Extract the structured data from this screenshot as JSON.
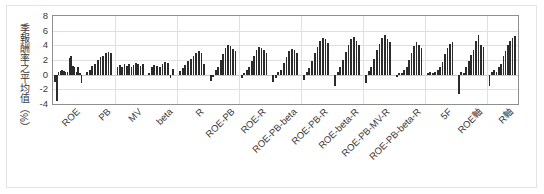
{
  "chart_data": {
    "type": "bar",
    "title": "",
    "subtitle": "",
    "xlabel": "",
    "ylabel": "季報酬率之平均值（%）",
    "ylim": [
      -4,
      8
    ],
    "yticks": [
      8,
      6,
      4,
      2,
      0,
      -2,
      -4
    ],
    "ytick_labels": [
      "8",
      "6",
      "4",
      "2",
      "0",
      "-2",
      "-4"
    ],
    "grid": true,
    "legend": "none",
    "categories": [
      "ROE",
      "PB",
      "MV",
      "beta",
      "R",
      "ROE-PB",
      "ROE-R",
      "ROE-PB-beta",
      "ROE-PB-R",
      "ROE-beta-R",
      "ROE-PB-MV-R",
      "ROE-PB-beta-R",
      "5F",
      "ROE軸",
      "R軸"
    ],
    "series": [
      {
        "name": "quarterly mean return by portfolio decile",
        "groups": [
          [
            -1.0,
            -3.6,
            0.4,
            0.5,
            0.6,
            0.5,
            0.3,
            0.4,
            2.3,
            2.5,
            1.2,
            1.0,
            0.4,
            1.1,
            0.2,
            -1.2
          ],
          [
            0.3,
            0.6,
            1.2,
            1.5,
            2.0,
            2.4,
            2.6,
            3.0,
            3.1,
            2.9
          ],
          [
            1.1,
            1.3,
            1.0,
            1.4,
            1.2,
            1.5,
            1.0,
            1.3,
            1.6,
            1.4,
            1.2,
            1.5
          ],
          [
            0.2,
            1.1,
            1.3,
            1.2,
            1.0,
            1.4,
            1.7,
            1.6,
            -0.4,
            0.8
          ],
          [
            0.5,
            0.9,
            1.3,
            1.8,
            2.2,
            2.6,
            2.9,
            3.2,
            3.0,
            1.4
          ],
          [
            -0.8,
            -0.3,
            0.6,
            1.1,
            2.0,
            2.8,
            3.6,
            4.0,
            3.9,
            3.5,
            3.2
          ],
          [
            -0.5,
            0.2,
            0.6,
            1.0,
            1.8,
            2.6,
            3.4,
            3.8,
            3.6,
            3.3,
            3.0
          ],
          [
            -1.0,
            -0.5,
            0.3,
            0.7,
            1.6,
            2.4,
            3.2,
            3.5,
            3.3,
            2.9
          ],
          [
            -0.7,
            0.3,
            0.9,
            1.8,
            2.9,
            3.8,
            4.6,
            5.0,
            4.8,
            4.3
          ],
          [
            -1.6,
            0.4,
            1.0,
            2.0,
            3.1,
            4.0,
            4.8,
            5.1,
            4.6,
            4.0
          ],
          [
            -1.2,
            0.5,
            1.1,
            2.2,
            3.3,
            4.2,
            5.0,
            5.4,
            4.9,
            4.4
          ],
          [
            -0.3,
            0.2,
            0.2,
            0.6,
            1.0,
            2.0,
            3.0,
            3.9,
            4.4,
            4.0,
            3.6
          ],
          [
            0.2,
            0.3,
            0.2,
            0.4,
            0.6,
            1.0,
            1.7,
            2.8,
            3.6,
            4.2,
            4.5
          ],
          [
            -2.6,
            0.3,
            0.2,
            1.0,
            1.8,
            2.7,
            3.4,
            4.6,
            5.4,
            4.0,
            3.8
          ],
          [
            -1.5,
            0.3,
            0.6,
            0.4,
            1.0,
            1.5,
            2.6,
            3.2,
            4.0,
            4.6,
            5.0,
            5.3
          ]
        ]
      }
    ],
    "colors": {
      "bar": "#2b2b2b",
      "axis": "#8f8f8f",
      "grid": "#e0e0e0",
      "text": "#3a3a3a",
      "background": "#ffffff"
    }
  }
}
